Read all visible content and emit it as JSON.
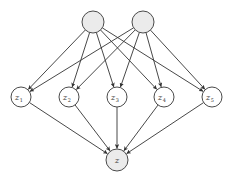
{
  "diagram": {
    "type": "directed-graph",
    "colors": {
      "observed_fill": "#ebebeb",
      "latent_fill": "#ffffff",
      "stroke": "#4a4a4a",
      "edge": "#333333"
    },
    "nodes": [
      {
        "id": "p1",
        "label": "",
        "x": 93,
        "y": 22,
        "r": 11,
        "shaded": true
      },
      {
        "id": "p2",
        "label": "",
        "x": 143,
        "y": 22,
        "r": 11,
        "shaded": true
      },
      {
        "id": "z1",
        "label": "z",
        "sub": "1",
        "x": 21,
        "y": 97,
        "r": 10,
        "shaded": false
      },
      {
        "id": "z2",
        "label": "z",
        "sub": "2",
        "x": 69,
        "y": 97,
        "r": 10,
        "shaded": false
      },
      {
        "id": "z3",
        "label": "z",
        "sub": "3",
        "x": 117,
        "y": 97,
        "r": 10,
        "shaded": false
      },
      {
        "id": "z4",
        "label": "z",
        "sub": "4",
        "x": 164,
        "y": 97,
        "r": 10,
        "shaded": false
      },
      {
        "id": "z5",
        "label": "z",
        "sub": "5",
        "x": 212,
        "y": 97,
        "r": 10,
        "shaded": false
      },
      {
        "id": "z",
        "label": "z",
        "sub": "",
        "x": 117,
        "y": 160,
        "r": 11,
        "shaded": true
      }
    ],
    "edges": [
      [
        "p1",
        "z1"
      ],
      [
        "p1",
        "z2"
      ],
      [
        "p1",
        "z3"
      ],
      [
        "p1",
        "z4"
      ],
      [
        "p1",
        "z5"
      ],
      [
        "p2",
        "z1"
      ],
      [
        "p2",
        "z2"
      ],
      [
        "p2",
        "z3"
      ],
      [
        "p2",
        "z4"
      ],
      [
        "p2",
        "z5"
      ],
      [
        "z1",
        "z"
      ],
      [
        "z2",
        "z"
      ],
      [
        "z3",
        "z"
      ],
      [
        "z4",
        "z"
      ],
      [
        "z5",
        "z"
      ]
    ]
  }
}
